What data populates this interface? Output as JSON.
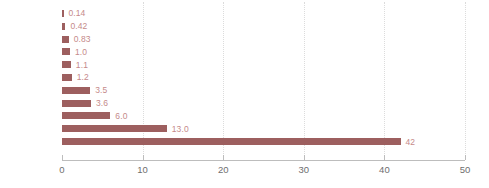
{
  "chart_data": {
    "type": "bar",
    "orientation": "horizontal",
    "title": "",
    "xlabel": "",
    "ylabel": "",
    "xlim": [
      0,
      50
    ],
    "xticks": [
      "0",
      "10",
      "20",
      "30",
      "40",
      "50"
    ],
    "grid": true,
    "grid_axis": "x",
    "legend": "none",
    "bar_color": "#9d5f5f",
    "value_label_color": "#c58a8a",
    "category_label_color": "#4d4d4d",
    "tick_label_color": "#6e6e6e",
    "categories": [
      "足底",
      "足首",
      "手掌",
      "前腕内側",
      "前腕外側",
      "背中",
      "頭皮",
      "腋窩",
      "頸部",
      "頬部",
      "陰嚢"
    ],
    "values": [
      0.14,
      0.42,
      0.83,
      1.0,
      1.1,
      1.2,
      3.5,
      3.6,
      6.0,
      13.0,
      42
    ],
    "value_labels": [
      "0.14",
      "0.42",
      "0.83",
      "1.0",
      "1.1",
      "1.2",
      "3.5",
      "3.6",
      "6.0",
      "13.0",
      "42"
    ]
  }
}
